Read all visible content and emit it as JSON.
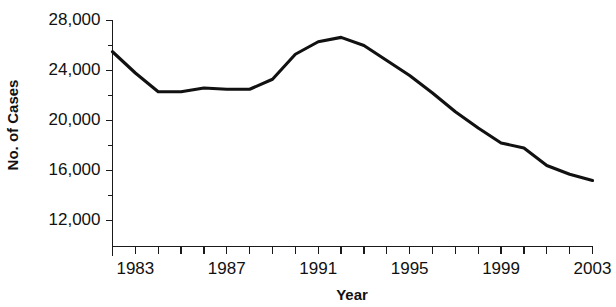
{
  "chart_data": {
    "type": "line",
    "title": "",
    "subtitle": "",
    "xlabel": "Year",
    "ylabel": "No. of Cases",
    "xlim": [
      1982,
      2003
    ],
    "ylim": [
      11000,
      28400
    ],
    "grid": false,
    "legend": null,
    "y_ticks_major": [
      "12,000",
      "16,000",
      "20,000",
      "24,000",
      "28,000"
    ],
    "y_ticks_major_values": [
      12000,
      16000,
      20000,
      24000,
      28000
    ],
    "y_minor_tick_interval": 2000,
    "x_ticks_labeled": [
      "1983",
      "1987",
      "1991",
      "1995",
      "1999",
      "2003"
    ],
    "x_ticks_labeled_values": [
      1983,
      1987,
      1991,
      1995,
      1999,
      2003
    ],
    "x_minor_tick_interval": 1,
    "x": [
      1982,
      1983,
      1984,
      1985,
      1986,
      1987,
      1988,
      1989,
      1990,
      1991,
      1992,
      1993,
      1994,
      1995,
      1996,
      1997,
      1998,
      1999,
      2000,
      2001,
      2002,
      2003
    ],
    "values": [
      25500,
      23800,
      22300,
      22300,
      22600,
      22500,
      22500,
      23300,
      25300,
      26300,
      26650,
      26000,
      24800,
      23600,
      22200,
      20700,
      19400,
      18200,
      17800,
      16400,
      15700,
      15200
    ],
    "series": [
      {
        "name": "No. of Cases",
        "color": "#111111",
        "values": [
          25500,
          23800,
          22300,
          22300,
          22600,
          22500,
          22500,
          23300,
          25300,
          26300,
          26650,
          26000,
          24800,
          23600,
          22200,
          20700,
          19400,
          18200,
          17800,
          16400,
          15700,
          15200
        ]
      }
    ]
  },
  "axes": {
    "y_title": "No. of Cases",
    "x_title": "Year"
  }
}
